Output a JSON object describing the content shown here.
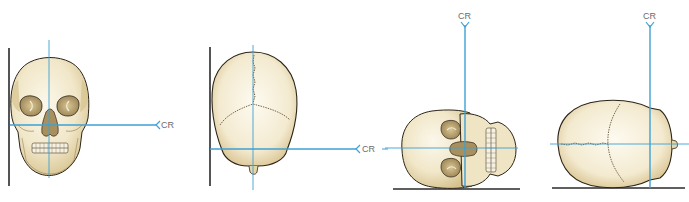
{
  "colors": {
    "central_ray": "#3ea0d4",
    "image_receptor": "#2a2a2a",
    "bone_light": "#f8f1dc",
    "bone_mid": "#eadfbf",
    "bone_shadow": "#c9b482",
    "outline": "#2b2418",
    "suture": "#6a5a3c",
    "cavity": "#b8a070",
    "cavity_dark": "#8c7548"
  },
  "panels": [
    {
      "id": "pa-axial",
      "view": "frontal skull",
      "cr_label": "CR",
      "cr_direction": "horizontal"
    },
    {
      "id": "ap-axial-vertex",
      "view": "skull vertex (posterior-superior)",
      "cr_label": "CR",
      "cr_direction": "horizontal"
    },
    {
      "id": "lateral-face-up",
      "view": "skull lying supine, face view rotated",
      "cr_label": "CR",
      "cr_direction": "vertical"
    },
    {
      "id": "lateral-vertex",
      "view": "skull vertex rotated",
      "cr_label": "CR",
      "cr_direction": "vertical"
    }
  ]
}
